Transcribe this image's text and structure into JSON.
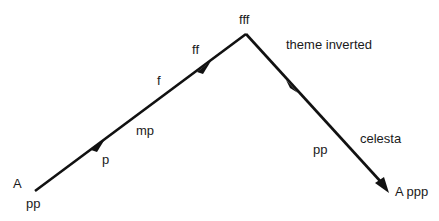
{
  "diagram": {
    "type": "dynamics-arch",
    "start": {
      "label_top": "A",
      "label_bottom": "pp"
    },
    "ascent_labels": {
      "p": "p",
      "mp": "mp",
      "f": "f",
      "ff": "ff"
    },
    "peak": {
      "label": "fff"
    },
    "descent_labels": {
      "theme": "theme inverted",
      "pp": "pp",
      "celesta": "celesta"
    },
    "end": {
      "label": "A ppp"
    },
    "line_color": "#111111"
  }
}
